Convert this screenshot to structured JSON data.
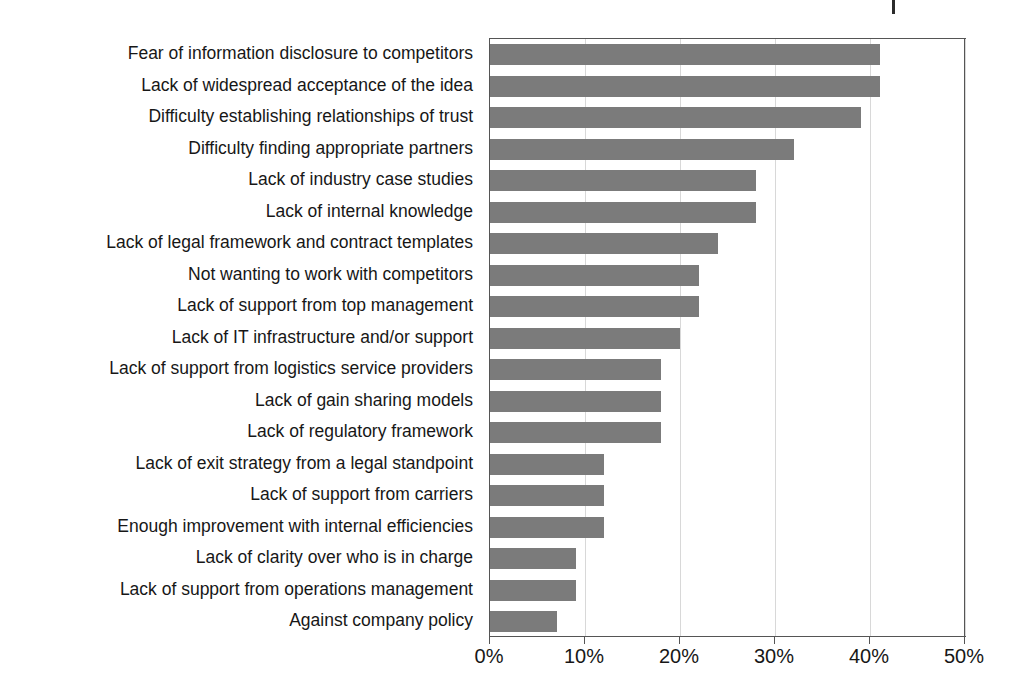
{
  "chart_data": {
    "type": "bar",
    "orientation": "horizontal",
    "title": "",
    "xlabel": "",
    "ylabel": "",
    "xlim": [
      0,
      50
    ],
    "xtick_labels": [
      "0%",
      "10%",
      "20%",
      "30%",
      "40%",
      "50%"
    ],
    "xticks": [
      0,
      10,
      20,
      30,
      40,
      50
    ],
    "grid": "vertical",
    "legend": "none",
    "bar_color": "#7b7b7b",
    "axis_color": "#555555",
    "gridline_color": "#d8d8d8",
    "value_suffix": "%",
    "categories": [
      "Fear of information disclosure to competitors",
      "Lack of widespread acceptance of the idea",
      "Difficulty establishing relationships of trust",
      "Difficulty finding appropriate partners",
      "Lack of industry case studies",
      "Lack of internal knowledge",
      "Lack of legal framework and contract templates",
      "Not wanting to work with competitors",
      "Lack of support from top management",
      "Lack of IT infrastructure and/or support",
      "Lack of support from logistics service providers",
      "Lack of gain sharing models",
      "Lack of regulatory framework",
      "Lack of exit strategy from a legal standpoint",
      "Lack of support from carriers",
      "Enough improvement with internal efficiencies",
      "Lack of clarity over who is in charge",
      "Lack of support from operations management",
      "Against company policy"
    ],
    "values": [
      41,
      41,
      39,
      32,
      28,
      28,
      24,
      22,
      22,
      20,
      18,
      18,
      18,
      12,
      12,
      12,
      9,
      9,
      7
    ]
  },
  "artifacts": {
    "clipped_title_ghost": ""
  }
}
